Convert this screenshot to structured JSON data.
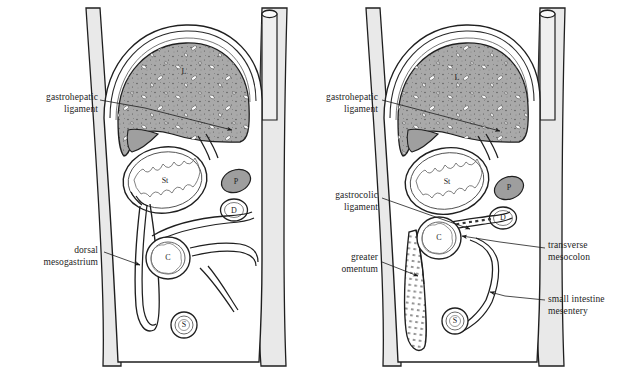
{
  "figure": {
    "background_color": "#ffffff",
    "width": 632,
    "height": 374
  },
  "palette": {
    "outline": "#1a1a1a",
    "liver_fill": "#a9a9a9",
    "pancreas_fill": "#9e9e9e",
    "body_wall_fill": "#e8e8e8",
    "cavity_fill": "#ffffff",
    "peritoneum_line": "#2b2b2b",
    "text": "#1d1d1d"
  },
  "panels": [
    {
      "id": "left-panel",
      "name": "earlier-stage",
      "organ_labels": [
        {
          "key": "L",
          "name": "liver",
          "x": 184,
          "y": 72
        },
        {
          "key": "St",
          "name": "stomach",
          "x": 165,
          "y": 181
        },
        {
          "key": "P",
          "name": "pancreas",
          "x": 236,
          "y": 182
        },
        {
          "key": "D",
          "name": "duodenum",
          "x": 234,
          "y": 211
        },
        {
          "key": "C",
          "name": "colon",
          "x": 168,
          "y": 258
        },
        {
          "key": "S",
          "name": "small-intestine",
          "x": 184,
          "y": 325
        }
      ],
      "callouts": [
        {
          "id": "gastrohepatic-ligament",
          "lines": [
            "gastrohepatic",
            "ligament"
          ],
          "text_x": 16,
          "text_y": 92,
          "align": "right",
          "text_w": 82,
          "leader": [
            [
              100,
              100
            ],
            [
              145,
              108
            ],
            [
              232,
              130
            ]
          ],
          "arrow": true
        },
        {
          "id": "dorsal-mesogastrium",
          "lines": [
            "dorsal",
            "mesogastrium"
          ],
          "text_x": 16,
          "text_y": 245,
          "align": "right",
          "text_w": 82,
          "leader": [
            [
              104,
              252
            ],
            [
              140,
              265
            ]
          ],
          "arrow": true
        }
      ]
    },
    {
      "id": "right-panel",
      "name": "later-stage",
      "organ_labels": [
        {
          "key": "L",
          "name": "liver",
          "x": 457,
          "y": 78
        },
        {
          "key": "St",
          "name": "stomach",
          "x": 447,
          "y": 182
        },
        {
          "key": "P",
          "name": "pancreas",
          "x": 509,
          "y": 188
        },
        {
          "key": "D",
          "name": "duodenum",
          "x": 503,
          "y": 218
        },
        {
          "key": "C",
          "name": "colon",
          "x": 439,
          "y": 238
        },
        {
          "key": "S",
          "name": "small-intestine",
          "x": 455,
          "y": 321
        }
      ],
      "callouts": [
        {
          "id": "gastrohepatic-ligament",
          "lines": [
            "gastrohepatic",
            "ligament"
          ],
          "text_x": 296,
          "text_y": 92,
          "align": "right",
          "text_w": 82,
          "leader": [
            [
              382,
              100
            ],
            [
              420,
              110
            ],
            [
              500,
              131
            ]
          ],
          "arrow": true
        },
        {
          "id": "gastrocolic-ligament",
          "lines": [
            "gastrocolic",
            "ligament"
          ],
          "text_x": 296,
          "text_y": 190,
          "align": "right",
          "text_w": 82,
          "leader": [
            [
              382,
              198
            ],
            [
              430,
              215
            ],
            [
              470,
              229
            ]
          ],
          "arrow": true
        },
        {
          "id": "greater-omentum",
          "lines": [
            "greater",
            "omentum"
          ],
          "text_x": 296,
          "text_y": 252,
          "align": "right",
          "text_w": 82,
          "leader": [
            [
              382,
              262
            ],
            [
              418,
              276
            ]
          ],
          "arrow": true
        },
        {
          "id": "transverse-mesocolon",
          "lines": [
            "transverse",
            "mesocolon"
          ],
          "text_x": 548,
          "text_y": 240,
          "align": "left",
          "text_w": 80,
          "leader": [
            [
              545,
              248
            ],
            [
              500,
              242
            ],
            [
              462,
              236
            ]
          ],
          "arrow": true
        },
        {
          "id": "small-intestine-mesentery",
          "lines": [
            "small intestine",
            "mesentery"
          ],
          "text_x": 548,
          "text_y": 294,
          "align": "left",
          "text_w": 82,
          "leader": [
            [
              545,
              300
            ],
            [
              505,
              296
            ],
            [
              490,
              292
            ]
          ],
          "arrow": true
        }
      ]
    }
  ],
  "legend_keys": [
    {
      "key": "L",
      "meaning": "liver"
    },
    {
      "key": "St",
      "meaning": "stomach"
    },
    {
      "key": "P",
      "meaning": "pancreas"
    },
    {
      "key": "D",
      "meaning": "duodenum"
    },
    {
      "key": "C",
      "meaning": "colon"
    },
    {
      "key": "S",
      "meaning": "small intestine"
    }
  ]
}
